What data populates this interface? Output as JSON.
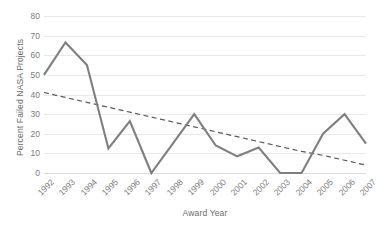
{
  "chart_data": {
    "type": "line",
    "title": "",
    "xlabel": "Award Year",
    "ylabel": "Percent Failed NASA Projects",
    "categories": [
      "1992",
      "1993",
      "1994",
      "1995",
      "1996",
      "1997",
      "1998",
      "1999",
      "2000",
      "2001",
      "2002",
      "2003",
      "2004",
      "2005",
      "2006",
      "2007"
    ],
    "series": [
      {
        "name": "Percent Failed NASA Projects",
        "type": "line",
        "style": "solid",
        "color": "#7f7f7f",
        "values": [
          50,
          66.5,
          55,
          12.5,
          26.5,
          0,
          15,
          30,
          14,
          8.5,
          13,
          0,
          0,
          20,
          30,
          15
        ]
      },
      {
        "name": "Linear trendline",
        "type": "line",
        "style": "dashed",
        "color": "#595959",
        "values": [
          41,
          38.5,
          36,
          33.5,
          31,
          28.5,
          26,
          23.5,
          21,
          18.5,
          16,
          13.5,
          11,
          9,
          6.5,
          4
        ]
      }
    ],
    "ylim": [
      0,
      80
    ],
    "yticks": [
      0,
      10,
      20,
      30,
      40,
      50,
      60,
      70,
      80
    ],
    "ytick_labels": [
      "0",
      "10",
      "20",
      "30",
      "40",
      "50",
      "60",
      "70",
      "80"
    ],
    "grid": "horizontal",
    "legend": "none",
    "xtick_rotation": -45
  },
  "colors": {
    "series_line": "#7f7f7f",
    "trendline": "#595959",
    "gridline": "#e9e9e9",
    "baseline": "#dcdcdc",
    "text": "#6b6b6b",
    "tick_text": "#7c7c7c",
    "background": "#ffffff"
  }
}
